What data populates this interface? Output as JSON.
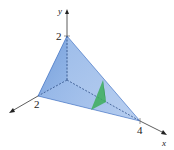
{
  "diagram": {
    "type": "3d-tetrahedron",
    "axes": {
      "y": {
        "label": "y",
        "tick_label": "2"
      },
      "z": {
        "tick_label": "2"
      },
      "x": {
        "label": "x",
        "tick_label": "4"
      }
    },
    "colors": {
      "solid_fill": "#5b8fd6",
      "solid_dark": "#2f64b8",
      "cross_section": "#3cae5a",
      "axis": "#333333"
    }
  }
}
